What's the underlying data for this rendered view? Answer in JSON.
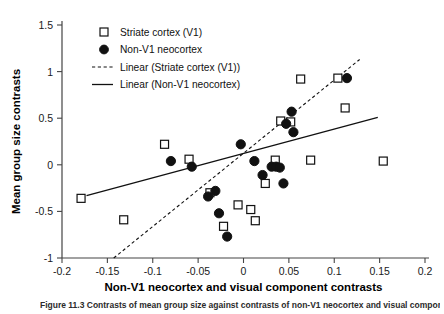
{
  "figure": {
    "caption": "Figure 11.3  Contrasts of mean group size against contrasts of non-V1 neocortex and visual component"
  },
  "chart_data": {
    "type": "scatter",
    "title": "",
    "xlabel": "Non-V1 neocortex and visual component contrasts",
    "ylabel": "Mean group size contrasts",
    "xlim": [
      -0.2,
      0.2
    ],
    "ylim": [
      -1,
      1.5
    ],
    "xticks": [
      -0.2,
      -0.15,
      -0.1,
      -0.05,
      0,
      0.05,
      0.1,
      0.15,
      0.2
    ],
    "xticklabels": [
      "-0.2",
      "-0.15",
      "-0.1",
      "-0.05",
      "0",
      "0.05",
      "0.1",
      "0.15",
      "0.2"
    ],
    "yticks": [
      -1,
      -0.5,
      0,
      0.5,
      1,
      1.5
    ],
    "yticklabels": [
      "-1",
      "-0.5",
      "0",
      "0.5",
      "1",
      "1.5"
    ],
    "grid": false,
    "legend_position": "top-left",
    "legend": [
      {
        "label": "Striate cortex (V1)",
        "marker": "open-square"
      },
      {
        "label": "Non-V1 neocortex",
        "marker": "filled-circle"
      },
      {
        "label": "Linear (Striate cortex (V1))",
        "marker": "dashed-line"
      },
      {
        "label": "Linear (Non-V1 neocortex)",
        "marker": "solid-line"
      }
    ],
    "series": [
      {
        "name": "Striate cortex (V1)",
        "marker": "open-square",
        "points": [
          [
            -0.179,
            -0.36
          ],
          [
            -0.132,
            -0.59
          ],
          [
            -0.087,
            0.22
          ],
          [
            -0.06,
            0.06
          ],
          [
            -0.037,
            -0.3
          ],
          [
            -0.022,
            -0.66
          ],
          [
            -0.006,
            -0.43
          ],
          [
            0.008,
            -0.48
          ],
          [
            0.013,
            -0.6
          ],
          [
            0.024,
            -0.2
          ],
          [
            0.035,
            0.05
          ],
          [
            0.041,
            0.47
          ],
          [
            0.052,
            0.46
          ],
          [
            0.063,
            0.92
          ],
          [
            0.074,
            0.05
          ],
          [
            0.104,
            0.93
          ],
          [
            0.112,
            0.61
          ],
          [
            0.154,
            0.04
          ]
        ]
      },
      {
        "name": "Non-V1 neocortex",
        "marker": "filled-circle",
        "points": [
          [
            -0.08,
            0.04
          ],
          [
            -0.057,
            -0.02
          ],
          [
            -0.039,
            -0.34
          ],
          [
            -0.031,
            -0.28
          ],
          [
            -0.027,
            -0.52
          ],
          [
            -0.018,
            -0.77
          ],
          [
            -0.003,
            0.22
          ],
          [
            0.012,
            0.04
          ],
          [
            0.021,
            -0.11
          ],
          [
            0.031,
            -0.02
          ],
          [
            0.036,
            -0.02
          ],
          [
            0.04,
            -0.03
          ],
          [
            0.044,
            -0.2
          ],
          [
            0.047,
            0.44
          ],
          [
            0.053,
            0.57
          ],
          [
            0.055,
            0.35
          ],
          [
            0.114,
            0.93
          ]
        ]
      }
    ],
    "fits": [
      {
        "name": "Linear (Non-V1 neocortex)",
        "style": "solid",
        "x0": -0.173,
        "y0": -0.33,
        "x1": 0.148,
        "y1": 0.51
      },
      {
        "name": "Linear (Striate cortex (V1))",
        "style": "dashed",
        "x0": -0.143,
        "y0": -1.0,
        "x1": 0.128,
        "y1": 1.13
      }
    ]
  }
}
